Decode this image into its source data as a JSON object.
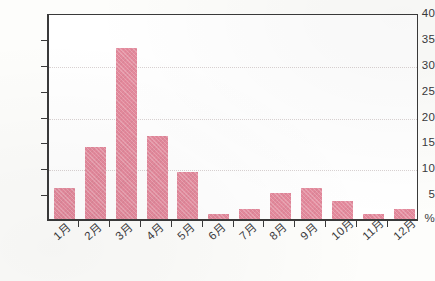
{
  "chart_data": {
    "type": "bar",
    "title": "",
    "subtitle": "",
    "xlabel": "",
    "ylabel": "%",
    "ylim": [
      0,
      40
    ],
    "ytick_values": [
      40,
      35,
      30,
      25,
      20,
      15,
      10,
      5
    ],
    "ytick_labels": [
      "40",
      "35",
      "30",
      "25",
      "20",
      "15",
      "10",
      "5"
    ],
    "origin_label": "%",
    "gridlines": [
      30,
      20,
      10
    ],
    "grid": true,
    "legend": null,
    "legend_position": "none",
    "categories": [
      "1月",
      "2月",
      "3月",
      "4月",
      "5月",
      "6月",
      "7月",
      "8月",
      "9月",
      "10月",
      "11月",
      "12月"
    ],
    "values": [
      6,
      14,
      33,
      16,
      9,
      1,
      2,
      5,
      6,
      3.5,
      1,
      2
    ],
    "bar_color": "#e58a9d",
    "axis_color": "#3a3a3a",
    "grid_color": "#d9d2d2"
  }
}
